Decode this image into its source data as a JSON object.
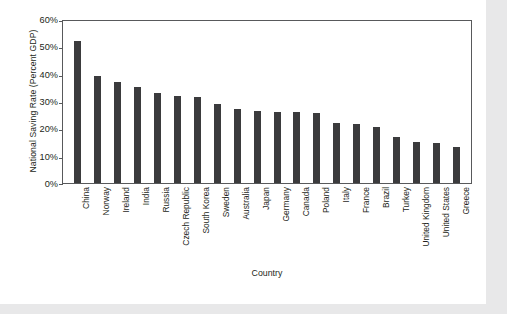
{
  "chart_data": {
    "type": "bar",
    "title": "",
    "xlabel": "Country",
    "ylabel": "National Saving Rate (Percent GDP)",
    "categories": [
      "China",
      "Norway",
      "Ireland",
      "India",
      "Russia",
      "Czech Republic",
      "South Korea",
      "Sweden",
      "Australia",
      "Japan",
      "Germany",
      "Canada",
      "Poland",
      "Italy",
      "France",
      "Brazil",
      "Turkey",
      "United Kingdom",
      "United States",
      "Greece"
    ],
    "values": [
      52,
      39,
      37,
      35,
      33,
      32,
      31.5,
      29,
      27,
      26.5,
      26,
      26,
      25.5,
      22,
      21.5,
      20.5,
      17,
      15,
      14.5,
      13
    ],
    "ylim": [
      0,
      60
    ],
    "ytick_labels": [
      "0%",
      "10%",
      "20%",
      "30%",
      "40%",
      "50%",
      "60%"
    ],
    "ytick_values": [
      0,
      10,
      20,
      30,
      40,
      50,
      60
    ],
    "grid": false,
    "legend": false,
    "bar_color": "#3b3b3d",
    "axis_color": "#58595b",
    "text_color": "#231f20",
    "plot_background": "#ffffff",
    "page_background": "#e8e8e9"
  }
}
